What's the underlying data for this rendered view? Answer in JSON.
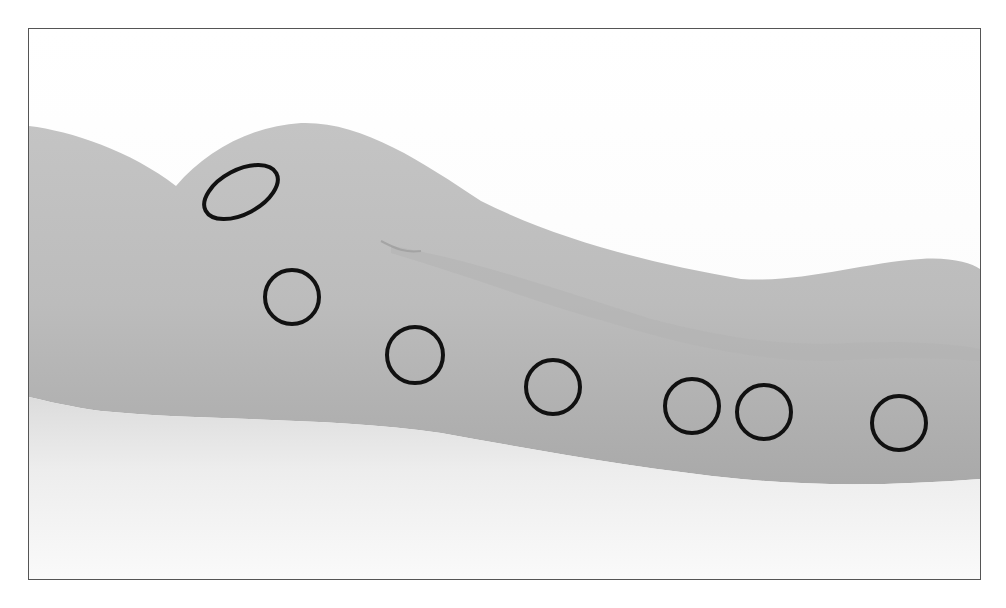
{
  "figure": {
    "frame": {
      "x": 28,
      "y": 28,
      "width": 951,
      "height": 550,
      "border_color": "#555555"
    },
    "colors": {
      "background": "#ffffff",
      "surface_light": "#f2f2f2",
      "surface_shadow": "#c8c8c8",
      "figure_tone": "#b9b9b9",
      "figure_shade": "#a6a6a6",
      "marker_stroke": "#111111"
    },
    "markers": [
      {
        "id": 1,
        "shape": "ellipse",
        "cx": 240,
        "cy": 191,
        "rx": 40,
        "ry": 22,
        "rotate": -28
      },
      {
        "id": 2,
        "shape": "circle",
        "cx": 291,
        "cy": 296,
        "r": 27
      },
      {
        "id": 3,
        "shape": "circle",
        "cx": 414,
        "cy": 354,
        "r": 28
      },
      {
        "id": 4,
        "shape": "circle",
        "cx": 552,
        "cy": 386,
        "r": 27
      },
      {
        "id": 5,
        "shape": "circle",
        "cx": 691,
        "cy": 405,
        "r": 27
      },
      {
        "id": 6,
        "shape": "circle",
        "cx": 763,
        "cy": 411,
        "r": 27
      },
      {
        "id": 7,
        "shape": "circle",
        "cx": 898,
        "cy": 422,
        "r": 27
      }
    ],
    "marker_count": 7
  }
}
